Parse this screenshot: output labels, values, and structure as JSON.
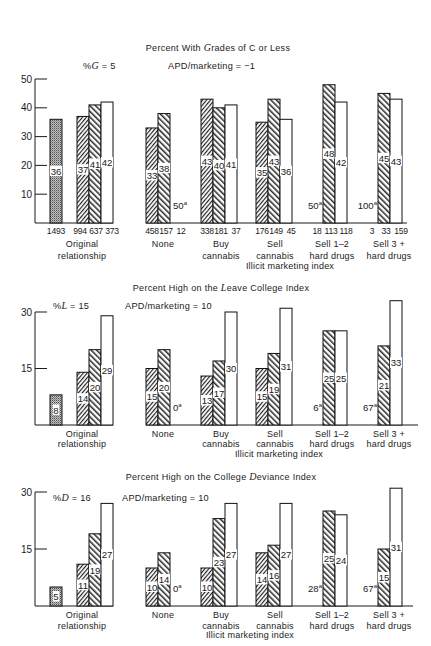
{
  "chart_data": [
    {
      "type": "bar",
      "title": "Percent With Grades of C or Less",
      "title_parts": [
        "Percent With ",
        "G",
        "rades of C or Less"
      ],
      "stat": "%G = 5",
      "stat_parts": [
        "%",
        "G",
        " = 5"
      ],
      "annotation": "APD/marketing = −1",
      "xlabel": "Illicit marketing index",
      "ylabel": "",
      "ylim": [
        0,
        50
      ],
      "yticks": [
        10,
        20,
        30,
        40,
        50
      ],
      "grid": false,
      "original_relationship": {
        "label": [
          "Original",
          "relationship"
        ],
        "total": {
          "value": 36,
          "n": "1493"
        },
        "values": [
          37,
          41,
          42
        ],
        "n": [
          "994",
          "637",
          "373"
        ]
      },
      "categories": [
        "None",
        "Buy cannabis",
        "Sell cannabis",
        "Sell 1–2 hard drugs",
        "Sell 3 + hard drugs"
      ],
      "category_lines": [
        [
          "None"
        ],
        [
          "Buy",
          "cannabis"
        ],
        [
          "Sell",
          "cannabis"
        ],
        [
          "Sell 1–2",
          "hard drugs"
        ],
        [
          "Sell 3 +",
          "hard drugs"
        ]
      ],
      "series": [
        {
          "name": "hatched (forward diagonal)",
          "values": [
            33,
            43,
            35,
            null,
            null
          ],
          "notes": [
            null,
            null,
            null,
            {
              "text": "50",
              "sup": "a"
            },
            {
              "text": "100",
              "sup": "a"
            }
          ],
          "n": [
            "458",
            "338",
            "176",
            "18",
            "3"
          ]
        },
        {
          "name": "hatched (backward diagonal)",
          "values": [
            38,
            40,
            43,
            48,
            45
          ],
          "notes": [
            null,
            null,
            null,
            null,
            null
          ],
          "n": [
            "157",
            "181",
            "149",
            "113",
            "33"
          ]
        },
        {
          "name": "open",
          "values": [
            null,
            41,
            36,
            42,
            43
          ],
          "notes": [
            {
              "text": "50",
              "sup": "a"
            },
            null,
            null,
            null,
            null
          ],
          "n": [
            "12",
            "37",
            "45",
            "118",
            "159"
          ]
        }
      ]
    },
    {
      "type": "bar",
      "title": "Percent High on the Leave College Index",
      "title_parts": [
        "Percent High on the ",
        "L",
        "eave College Index"
      ],
      "stat": "%L = 15",
      "stat_parts": [
        "%",
        "L",
        " = 15"
      ],
      "annotation": "APD/marketing = 10",
      "xlabel": "Illicit marketing index",
      "ylabel": "",
      "ylim": [
        0,
        30
      ],
      "yticks": [
        15,
        30
      ],
      "grid": false,
      "original_relationship": {
        "label": [
          "Original",
          "relationship"
        ],
        "total": {
          "value": 8
        },
        "values": [
          14,
          20,
          29
        ]
      },
      "categories": [
        "None",
        "Buy cannabis",
        "Sell cannabis",
        "Sell 1–2 hard drugs",
        "Sell 3 + hard drugs"
      ],
      "category_lines": [
        [
          "None"
        ],
        [
          "Buy",
          "cannabis"
        ],
        [
          "Sell",
          "cannabis"
        ],
        [
          "Sell 1–2",
          "hard drugs"
        ],
        [
          "Sell 3 +",
          "hard drugs"
        ]
      ],
      "series": [
        {
          "name": "hatched (forward diagonal)",
          "values": [
            15,
            13,
            15,
            null,
            null
          ],
          "notes": [
            null,
            null,
            null,
            {
              "text": "6",
              "sup": "a"
            },
            {
              "text": "67",
              "sup": "a"
            }
          ]
        },
        {
          "name": "hatched (backward diagonal)",
          "values": [
            20,
            17,
            19,
            25,
            21
          ],
          "notes": [
            null,
            null,
            null,
            null,
            null
          ]
        },
        {
          "name": "open",
          "values": [
            null,
            30,
            31,
            25,
            33
          ],
          "notes": [
            {
              "text": "0",
              "sup": "a"
            },
            null,
            null,
            null,
            null
          ]
        }
      ]
    },
    {
      "type": "bar",
      "title": "Percent High on the College Deviance Index",
      "title_parts": [
        "Percent High on the College ",
        "D",
        "eviance Index"
      ],
      "stat": "%D = 16",
      "stat_parts": [
        "%",
        "D",
        " = 16"
      ],
      "annotation": "APD/marketing = 10",
      "xlabel": "Illicit marketing index",
      "ylabel": "",
      "ylim": [
        0,
        30
      ],
      "yticks": [
        15,
        30
      ],
      "grid": false,
      "original_relationship": {
        "label": [
          "Original",
          "relationship"
        ],
        "total": {
          "value": 5
        },
        "values": [
          11,
          19,
          27
        ]
      },
      "categories": [
        "None",
        "Buy cannabis",
        "Sell cannabis",
        "Sell 1–2 hard drugs",
        "Sell 3 + hard drugs"
      ],
      "category_lines": [
        [
          "None"
        ],
        [
          "Buy",
          "cannabis"
        ],
        [
          "Sell",
          "cannabis"
        ],
        [
          "Sell 1–2",
          "hard drugs"
        ],
        [
          "Sell 3 +",
          "hard drugs"
        ]
      ],
      "series": [
        {
          "name": "hatched (forward diagonal)",
          "values": [
            10,
            10,
            14,
            null,
            null
          ],
          "notes": [
            null,
            null,
            null,
            {
              "text": "28",
              "sup": "a"
            },
            {
              "text": "67",
              "sup": "a"
            }
          ]
        },
        {
          "name": "hatched (backward diagonal)",
          "values": [
            14,
            23,
            16,
            25,
            15
          ],
          "notes": [
            null,
            null,
            null,
            null,
            null
          ]
        },
        {
          "name": "open",
          "values": [
            null,
            27,
            27,
            24,
            31
          ],
          "notes": [
            {
              "text": "0",
              "sup": "a"
            },
            null,
            null,
            null,
            null
          ]
        }
      ]
    }
  ]
}
